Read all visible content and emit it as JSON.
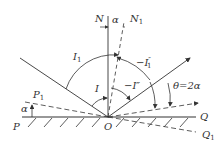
{
  "diagram": {
    "type": "reflection-geometry",
    "labels": {
      "N": "N",
      "N1": "N",
      "N1_sub": "1",
      "alpha_top": "α",
      "I1": "I",
      "I1_sub": "1",
      "neg_I1pp": "−I",
      "neg_I1pp_sup": "″",
      "neg_I1pp_sub": "1",
      "I": "I",
      "neg_Ipp": "−I″",
      "theta": "θ=2α",
      "P1": "P",
      "P1_sub": "1",
      "alpha_left": "α",
      "P": "P",
      "O": "O",
      "Q": "Q",
      "Q1": "Q",
      "Q1_sub": "1"
    },
    "colors": {
      "line": "#333333",
      "background": "#ffffff"
    }
  }
}
